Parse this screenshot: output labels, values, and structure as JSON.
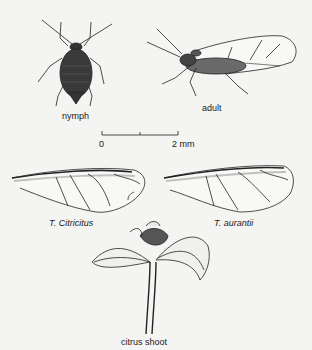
{
  "figure": {
    "labels": {
      "nymph": "nymph",
      "adult": "adult",
      "wing_left": "T. Citricitus",
      "wing_right": "T. aurantii",
      "shoot": "citrus shoot"
    },
    "scale_bar": {
      "start_label": "0",
      "end_label": "2 mm"
    },
    "colors": {
      "background": "#f4f4f2",
      "ink": "#222222"
    }
  }
}
